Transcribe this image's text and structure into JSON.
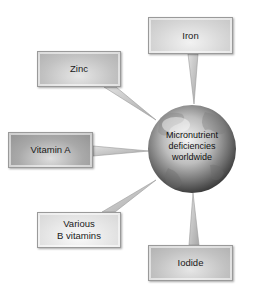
{
  "center": {
    "label_lines": [
      "Micronutrient",
      "deficiencies",
      "worldwide"
    ],
    "icon": "globe-icon"
  },
  "nodes": {
    "iron": {
      "label": "Iron"
    },
    "zinc": {
      "label": "Zinc"
    },
    "vitamin_a": {
      "label": "Vitamin A"
    },
    "b_vitamins": {
      "label_lines": [
        "Various",
        "B vitamins"
      ]
    },
    "iodide": {
      "label": "Iodide"
    }
  },
  "colors": {
    "background": "#ffffff",
    "box_border": "#9a9a9a",
    "text": "#1a1a1a",
    "globe_light": "#f4f4f4",
    "globe_dark": "#4a4a4a"
  }
}
